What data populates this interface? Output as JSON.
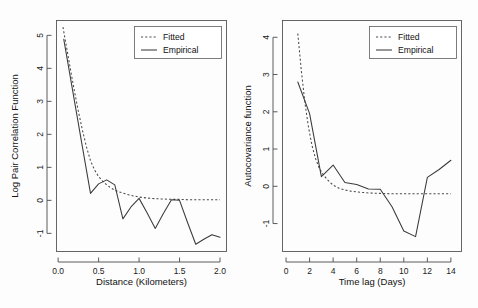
{
  "figure": {
    "panel_count": 2,
    "background": "#fdfdfd",
    "line_color": "#3a3a3a"
  },
  "chart_data": [
    {
      "type": "line",
      "panel": "left",
      "title": "",
      "xlabel": "Distance (Kilometers)",
      "ylabel": "Log Pair Correlation Function",
      "xlim": [
        -0.02,
        2.08
      ],
      "ylim": [
        -1.55,
        5.45
      ],
      "xticks": [
        0.0,
        0.5,
        1.0,
        1.5,
        2.0
      ],
      "xticklabels": [
        "0.0",
        "0.5",
        "1.0",
        "1.5",
        "2.0"
      ],
      "yticks": [
        -1,
        0,
        1,
        2,
        3,
        4,
        5
      ],
      "yticklabels": [
        "-1",
        "0",
        "1",
        "2",
        "3",
        "4",
        "5"
      ],
      "grid": false,
      "legend_position": "top-right",
      "legend": [
        "Fitted",
        "Empirical"
      ],
      "series": [
        {
          "name": "Fitted",
          "style": "dashed",
          "x": [
            0.06,
            0.1,
            0.15,
            0.2,
            0.25,
            0.3,
            0.35,
            0.4,
            0.45,
            0.5,
            0.55,
            0.6,
            0.65,
            0.7,
            0.75,
            0.8,
            0.9,
            1.0,
            1.1,
            1.2,
            1.3,
            1.4,
            1.5,
            1.6,
            1.7,
            1.8,
            1.9,
            2.0
          ],
          "y": [
            5.25,
            4.7,
            4.0,
            3.33,
            2.7,
            2.13,
            1.62,
            1.2,
            0.92,
            0.72,
            0.58,
            0.47,
            0.38,
            0.31,
            0.26,
            0.22,
            0.15,
            0.1,
            0.07,
            0.05,
            0.04,
            0.03,
            0.03,
            0.02,
            0.02,
            0.02,
            0.02,
            0.02
          ]
        },
        {
          "name": "Empirical",
          "style": "solid",
          "x": [
            0.07,
            0.3,
            0.4,
            0.5,
            0.6,
            0.7,
            0.8,
            0.9,
            1.0,
            1.1,
            1.2,
            1.3,
            1.4,
            1.5,
            1.6,
            1.7,
            1.8,
            1.9,
            2.0
          ],
          "y": [
            4.88,
            1.62,
            0.21,
            0.5,
            0.62,
            0.47,
            -0.56,
            -0.2,
            0.06,
            -0.38,
            -0.85,
            -0.4,
            0.02,
            0.0,
            -0.68,
            -1.33,
            -1.18,
            -1.04,
            -1.12
          ]
        }
      ]
    },
    {
      "type": "line",
      "panel": "right",
      "title": "",
      "xlabel": "Time lag (Days)",
      "ylabel": "Autocovariance function",
      "xlim": [
        -0.3,
        14.9
      ],
      "ylim": [
        -1.75,
        4.45
      ],
      "xticks": [
        0,
        2,
        4,
        6,
        8,
        10,
        12,
        14
      ],
      "xticklabels": [
        "0",
        "2",
        "4",
        "6",
        "8",
        "10",
        "12",
        "14"
      ],
      "yticks": [
        -1,
        0,
        1,
        2,
        3,
        4
      ],
      "yticklabels": [
        "-1",
        "0",
        "1",
        "2",
        "3",
        "4"
      ],
      "grid": false,
      "legend_position": "top-right",
      "legend": [
        "Fitted",
        "Empirical"
      ],
      "series": [
        {
          "name": "Fitted",
          "style": "dashed",
          "x": [
            1.0,
            1.3,
            1.6,
            1.9,
            2.2,
            2.5,
            2.8,
            3.1,
            3.5,
            4.0,
            4.5,
            5.0,
            5.5,
            6.0,
            7.0,
            8.0,
            9.0,
            10.0,
            11.0,
            12.0,
            13.0,
            14.0
          ],
          "y": [
            4.1,
            3.1,
            2.25,
            1.6,
            1.1,
            0.75,
            0.5,
            0.34,
            0.18,
            0.03,
            -0.05,
            -0.1,
            -0.13,
            -0.15,
            -0.18,
            -0.19,
            -0.2,
            -0.2,
            -0.2,
            -0.2,
            -0.2,
            -0.2
          ]
        },
        {
          "name": "Empirical",
          "style": "solid",
          "x": [
            1,
            2,
            3,
            4,
            5,
            6,
            7,
            8,
            9,
            10,
            11,
            12,
            13,
            14
          ],
          "y": [
            2.8,
            1.95,
            0.26,
            0.57,
            0.1,
            0.05,
            -0.07,
            -0.08,
            -0.55,
            -1.2,
            -1.35,
            0.24,
            0.45,
            0.7
          ]
        }
      ]
    }
  ]
}
